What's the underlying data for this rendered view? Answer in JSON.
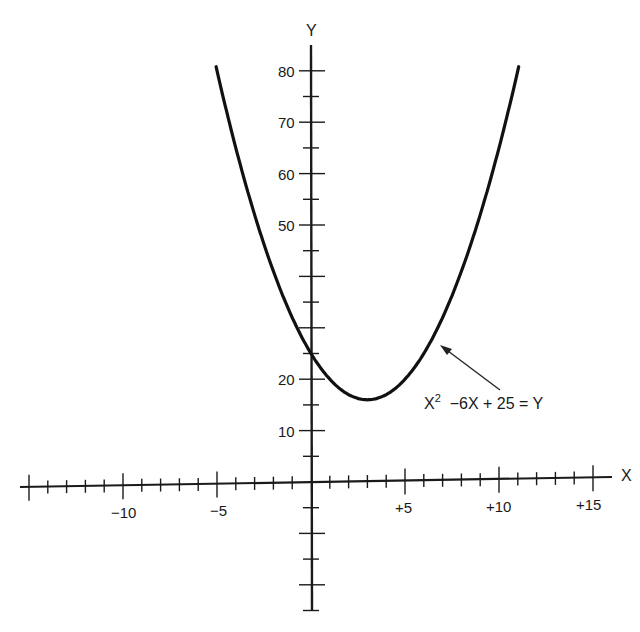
{
  "chart_data": {
    "type": "line",
    "title": "",
    "xlabel": "X",
    "ylabel": "Y",
    "equation_label": "X² −6X + 25 = Y",
    "equation": "y = x^2 - 6x + 25",
    "xlim": [
      -15,
      15
    ],
    "ylim": [
      -30,
      85
    ],
    "grid": false,
    "legend": "none",
    "x_tick_labels": [
      "−10",
      "−5",
      "+5",
      "+10",
      "+15"
    ],
    "x_tick_values": [
      -10,
      -5,
      5,
      10,
      15
    ],
    "y_tick_labels": [
      "10",
      "20",
      "50",
      "60",
      "70",
      "80"
    ],
    "y_tick_values": [
      10,
      20,
      50,
      60,
      70,
      80
    ],
    "series": [
      {
        "name": "X² −6X + 25 = Y",
        "x": [
          -5,
          -4,
          -3,
          -2,
          -1,
          0,
          1,
          2,
          3,
          4,
          5,
          6,
          7,
          8,
          9,
          10,
          11
        ],
        "y": [
          80,
          65,
          52,
          41,
          32,
          25,
          20,
          17,
          16,
          17,
          20,
          25,
          32,
          41,
          52,
          65,
          80
        ]
      }
    ],
    "annotations": [
      {
        "text": "X² −6X + 25 = Y",
        "arrow_to": {
          "x": 6.8,
          "y": 31
        }
      }
    ],
    "vertex": {
      "x": 3,
      "y": 16
    },
    "y_intercept": {
      "x": 0,
      "y": 25
    }
  },
  "labels": {
    "x_axis": "X",
    "y_axis": "Y",
    "eq_base": "X",
    "eq_sup": "2",
    "eq_rest": "  −6X + 25 = Y",
    "xticks": [
      "−10",
      "−5",
      "+5",
      "+10",
      "+15"
    ],
    "yticks": [
      "80",
      "70",
      "60",
      "50",
      "20",
      "10"
    ]
  }
}
